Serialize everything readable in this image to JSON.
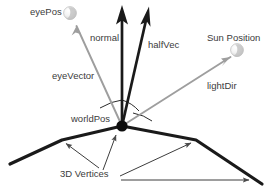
{
  "diagram": {
    "background_color": "#ffffff",
    "width": 271,
    "height": 190,
    "colors": {
      "text": "#3b3b3b",
      "vector_dark": "#1a1a1a",
      "vector_gray": "#8f8f8f",
      "terrain": "#1a1a1a",
      "leader_line": "#4a4a4a",
      "sphere_fill": "#e8e8e8",
      "sphere_edge": "#b4b4b4",
      "point_fill": "#0d0d0d"
    },
    "labels": {
      "eye_pos": "eyePos",
      "normal": "normal",
      "half_vec": "halfVec",
      "sun_position": "Sun Position",
      "eye_vector": "eyeVector",
      "light_dir": "lightDir",
      "world_pos": "worldPos",
      "vertices": "3D Vertices"
    },
    "nodes": [
      {
        "name": "eyePos-sphere",
        "x": 70,
        "y": 13,
        "r": 6,
        "style": "light-sphere"
      },
      {
        "name": "sun-sphere",
        "x": 237,
        "y": 50,
        "r": 6,
        "style": "light-sphere"
      },
      {
        "name": "worldPos-point",
        "x": 122,
        "y": 126,
        "r": 5.5,
        "style": "solid-dot"
      }
    ],
    "vectors": [
      {
        "name": "normal",
        "from_x": 122,
        "from_y": 126,
        "to_x": 122,
        "to_y": 6,
        "color": "#1a1a1a",
        "width": 2.6
      },
      {
        "name": "halfVec",
        "from_x": 122,
        "from_y": 126,
        "to_x": 150,
        "to_y": 7,
        "color": "#1a1a1a",
        "width": 2.6
      },
      {
        "name": "eyeVector",
        "from_x": 122,
        "from_y": 126,
        "to_x": 77,
        "to_y": 27,
        "color": "#9a9a9a",
        "width": 1.8
      },
      {
        "name": "lightDir",
        "from_x": 122,
        "from_y": 126,
        "to_x": 230,
        "to_y": 57,
        "color": "#9a9a9a",
        "width": 1.8
      }
    ],
    "terrain_points": "10,164 62,140 122,126 196,140 250,176 262,184",
    "vertex_leaders": [
      {
        "name": "leader-left-vertex",
        "from_x": 97,
        "from_y": 168,
        "to_x": 64,
        "to_y": 142
      },
      {
        "name": "leader-center-vertex",
        "from_x": 101,
        "from_y": 170,
        "to_x": 117,
        "to_y": 134
      },
      {
        "name": "leader-right-vertex",
        "from_x": 121,
        "from_y": 176,
        "to_x": 193,
        "to_y": 143
      },
      {
        "name": "leader-far-right",
        "from_x": 122,
        "from_y": 180,
        "to_x": 251,
        "to_y": 180
      }
    ],
    "angle_arcs": [
      {
        "name": "arc-eye-normal",
        "d": "M 100 108 Q 112 102 122 101"
      },
      {
        "name": "arc-normal-half",
        "d": "M 122 101 Q 131 103 138 110"
      },
      {
        "name": "arc-half-light",
        "d": "M 134 114 Q 144 115 151 120"
      }
    ]
  }
}
